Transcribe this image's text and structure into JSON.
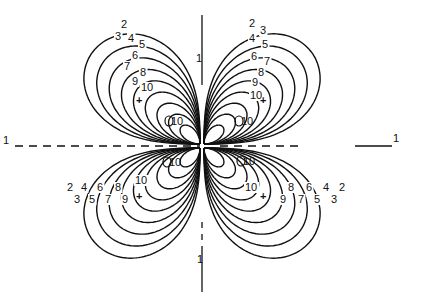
{
  "figure": {
    "type": "contour-diagram",
    "ink_color": "#111111",
    "background": "#ffffff",
    "contour_levels": [
      2,
      3,
      4,
      5,
      6,
      7,
      8,
      9,
      10
    ],
    "axes": {
      "horizontal": {
        "style": "dashed",
        "left_label": "1",
        "right_label": "1"
      },
      "vertical": {
        "style": "solid-dashed",
        "top_label": "1",
        "bottom_label": "1"
      }
    },
    "center": {
      "x": 210,
      "y": 150
    },
    "lobes": [
      {
        "id": "upper-left",
        "max_marker": "+",
        "max_x": 139,
        "max_y": 100,
        "secondary_label": "10",
        "secondary_x": 166,
        "secondary_y": 122
      },
      {
        "id": "upper-right",
        "max_marker": "+",
        "max_x": 263,
        "max_y": 100,
        "secondary_label": "10",
        "secondary_x": 236,
        "secondary_y": 122
      },
      {
        "id": "lower-left",
        "max_marker": "+",
        "max_x": 139,
        "max_y": 196,
        "secondary_label": "10",
        "secondary_x": 164,
        "secondary_y": 163
      },
      {
        "id": "lower-right",
        "max_marker": "+",
        "max_x": 263,
        "max_y": 196,
        "secondary_label": "10",
        "secondary_x": 238,
        "secondary_y": 162
      }
    ],
    "labels": {
      "upper_left": [
        {
          "text": "2",
          "x": 121,
          "y": 28
        },
        {
          "text": "3",
          "x": 115,
          "y": 40
        },
        {
          "text": "4",
          "x": 128,
          "y": 42
        },
        {
          "text": "5",
          "x": 139,
          "y": 48
        },
        {
          "text": "6",
          "x": 132,
          "y": 59
        },
        {
          "text": "7",
          "x": 124,
          "y": 70
        },
        {
          "text": "8",
          "x": 140,
          "y": 76
        },
        {
          "text": "9",
          "x": 132,
          "y": 85
        },
        {
          "text": "10",
          "x": 141,
          "y": 91
        }
      ],
      "upper_right": [
        {
          "text": "2",
          "x": 249,
          "y": 27
        },
        {
          "text": "3",
          "x": 260,
          "y": 34
        },
        {
          "text": "4",
          "x": 249,
          "y": 42
        },
        {
          "text": "5",
          "x": 262,
          "y": 48
        },
        {
          "text": "6",
          "x": 251,
          "y": 60
        },
        {
          "text": "7",
          "x": 264,
          "y": 65
        },
        {
          "text": "8",
          "x": 258,
          "y": 76
        },
        {
          "text": "9",
          "x": 252,
          "y": 86
        },
        {
          "text": "10",
          "x": 250,
          "y": 99
        }
      ],
      "lower_left": [
        {
          "text": "2",
          "x": 67,
          "y": 191
        },
        {
          "text": "4",
          "x": 81,
          "y": 191
        },
        {
          "text": "6",
          "x": 97,
          "y": 191
        },
        {
          "text": "8",
          "x": 115,
          "y": 191
        },
        {
          "text": "3",
          "x": 74,
          "y": 203
        },
        {
          "text": "5",
          "x": 89,
          "y": 203
        },
        {
          "text": "7",
          "x": 105,
          "y": 203
        },
        {
          "text": "9",
          "x": 122,
          "y": 203
        },
        {
          "text": "10",
          "x": 135,
          "y": 184
        }
      ],
      "lower_right": [
        {
          "text": "10",
          "x": 245,
          "y": 191
        },
        {
          "text": "8",
          "x": 288,
          "y": 191
        },
        {
          "text": "6",
          "x": 306,
          "y": 191
        },
        {
          "text": "4",
          "x": 323,
          "y": 191
        },
        {
          "text": "2",
          "x": 339,
          "y": 191
        },
        {
          "text": "9",
          "x": 280,
          "y": 203
        },
        {
          "text": "7",
          "x": 298,
          "y": 203
        },
        {
          "text": "5",
          "x": 314,
          "y": 203
        },
        {
          "text": "3",
          "x": 331,
          "y": 203
        }
      ]
    }
  }
}
